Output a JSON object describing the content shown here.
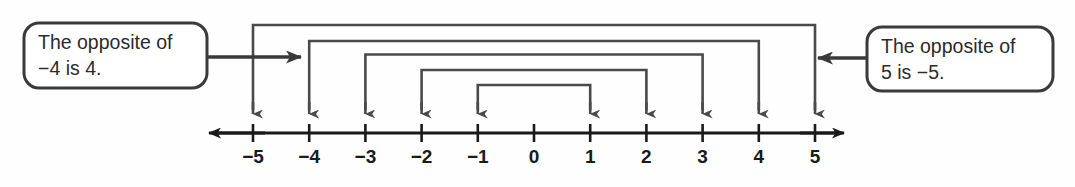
{
  "figure": {
    "background_color": "#fefefe",
    "line_color": "#2b2b2b",
    "bracket_color": "#4a4a4a",
    "text_color": "#1a1a1a"
  },
  "number_line": {
    "name": "number-line",
    "min": -5,
    "max": 5,
    "step": 1,
    "ticks": [
      {
        "value": -5,
        "label": "−5"
      },
      {
        "value": -4,
        "label": "−4"
      },
      {
        "value": -3,
        "label": "−3"
      },
      {
        "value": -2,
        "label": "−2"
      },
      {
        "value": -1,
        "label": "−1"
      },
      {
        "value": 0,
        "label": "0"
      },
      {
        "value": 1,
        "label": "1"
      },
      {
        "value": 2,
        "label": "2"
      },
      {
        "value": 3,
        "label": "3"
      },
      {
        "value": 4,
        "label": "4"
      },
      {
        "value": 5,
        "label": "5"
      }
    ],
    "labels": [
      "−5",
      "−4",
      "−3",
      "−2",
      "−1",
      "0",
      "1",
      "2",
      "3",
      "4",
      "5"
    ],
    "has_left_arrow": true,
    "has_right_arrow": true
  },
  "opposite_pairs": [
    {
      "left": -5,
      "right": 5,
      "left_label": "−5",
      "right_label": "5"
    },
    {
      "left": -4,
      "right": 4,
      "left_label": "−4",
      "right_label": "4"
    },
    {
      "left": -3,
      "right": 3,
      "left_label": "−3",
      "right_label": "3"
    },
    {
      "left": -2,
      "right": 2,
      "left_label": "−2",
      "right_label": "2"
    },
    {
      "left": -1,
      "right": 1,
      "left_label": "−1",
      "right_label": "1"
    }
  ],
  "callouts": {
    "left": {
      "name": "callout-left",
      "line1": "The opposite of",
      "line2": "−4 is 4.",
      "points_to": -4,
      "arrow_direction": "right"
    },
    "right": {
      "name": "callout-right",
      "line1": "The opposite of",
      "line2": "5 is −5.",
      "points_to": 5,
      "arrow_direction": "left"
    }
  },
  "chart_data": {
    "type": "line",
    "xlabel": "",
    "ylabel": "",
    "xlim": [
      -5,
      5
    ],
    "categories": [
      "−5",
      "−4",
      "−3",
      "−2",
      "−1",
      "0",
      "1",
      "2",
      "3",
      "4",
      "5"
    ],
    "values": [
      -5,
      -4,
      -3,
      -2,
      -1,
      0,
      1,
      2,
      3,
      4,
      5
    ],
    "annotations": [
      "The opposite of −4 is 4.",
      "The opposite of 5 is −5."
    ],
    "grid": false,
    "legend": "none"
  }
}
